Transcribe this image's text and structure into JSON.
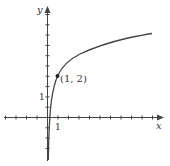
{
  "chart_data": {
    "type": "line",
    "title": "",
    "xlabel": "x",
    "ylabel": "y",
    "x_tick_labels": [
      "1"
    ],
    "y_tick_labels": [
      "1"
    ],
    "xlim": [
      -4,
      11
    ],
    "ylim": [
      -2,
      5.2
    ],
    "grid": false,
    "legend": null,
    "series": [
      {
        "name": "curve",
        "description": "increasing concave logarithmic-type curve through (1, 2), steep near the y-axis",
        "x": [
          0.03,
          0.1,
          0.3,
          0.6,
          1,
          2,
          3,
          5,
          7.5,
          10
        ],
        "y": [
          -2.0,
          -0.1,
          0.9,
          1.55,
          2,
          2.6,
          3.0,
          3.45,
          3.85,
          4.1
        ]
      }
    ],
    "annotations": [
      {
        "text": "(1, 2)",
        "x": 1,
        "y": 2,
        "marker": "filled-dot"
      }
    ],
    "color": "#444444"
  },
  "labels": {
    "x_axis": "x",
    "y_axis": "y",
    "x_tick_one": "1",
    "y_tick_one": "1",
    "point": "(1, 2)"
  }
}
